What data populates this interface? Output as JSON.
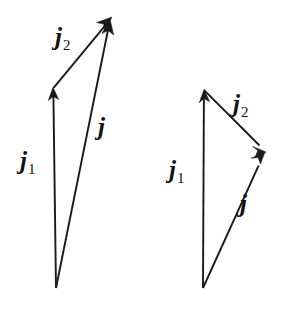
{
  "figure": {
    "width": 284,
    "height": 309,
    "background_color": "#ffffff",
    "stroke_color": "#1a1a1a",
    "label_color": "#111111"
  },
  "diagrams": [
    {
      "name": "left-diagram",
      "description": "Vector triangle with j1 and j2 summing to resultant j, obtuse arrangement",
      "vectors": [
        {
          "name": "j1",
          "symbol": "j",
          "subscript": "1",
          "from": [
            56,
            288
          ],
          "to": [
            53,
            88
          ],
          "label_x": 20,
          "label_y": 148
        },
        {
          "name": "j2",
          "symbol": "j",
          "subscript": "2",
          "from": [
            53,
            88
          ],
          "to": [
            112,
            17
          ],
          "label_x": 55,
          "label_y": 24
        },
        {
          "name": "j",
          "symbol": "j",
          "subscript": "",
          "from": [
            56,
            288
          ],
          "to": [
            110,
            19
          ],
          "label_x": 98,
          "label_y": 114
        }
      ]
    },
    {
      "name": "right-diagram",
      "description": "Vector triangle with j1 and j2 summing to resultant j, acute arrangement",
      "vectors": [
        {
          "name": "j1",
          "symbol": "j",
          "subscript": "1",
          "from": [
            203,
            288
          ],
          "to": [
            204,
            90
          ],
          "label_x": 169,
          "label_y": 157
        },
        {
          "name": "j2",
          "symbol": "j",
          "subscript": "2",
          "from": [
            204,
            90
          ],
          "to": [
            266,
            152
          ],
          "label_x": 233,
          "label_y": 91
        },
        {
          "name": "j",
          "symbol": "j",
          "subscript": "",
          "from": [
            203,
            288
          ],
          "to": [
            265,
            152
          ],
          "label_x": 240,
          "label_y": 191
        }
      ]
    }
  ]
}
